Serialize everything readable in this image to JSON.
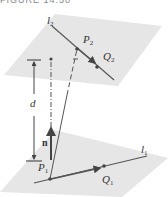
{
  "caption": "FIGURE 14.50",
  "labels": {
    "l2": "l",
    "l2_sub": "2",
    "P2": "P",
    "P2_sub": "2",
    "Q2": "Q",
    "Q2_sub": "2",
    "d": "d",
    "n": "n",
    "P1": "P",
    "P1_sub": "1",
    "Q1": "Q",
    "Q1_sub": "1",
    "l1": "l",
    "l1_sub": "1"
  },
  "colors": {
    "plane": "#e6e6e6",
    "line": "#555555",
    "point": "#444444"
  }
}
